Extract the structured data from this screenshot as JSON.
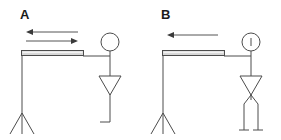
{
  "figure": {
    "width": 281,
    "height": 140,
    "background_color": "#ffffff",
    "line_color": "#4c4c4c",
    "bar_fill_color": "#d6d6d6",
    "label_color": "#1a1a1a",
    "panels": [
      {
        "id": "panel-a",
        "label": "A",
        "label_x": 20,
        "label_y": 19,
        "arrows": [
          {
            "id": "arrow-left",
            "direction": "left",
            "x_start": 78,
            "x_end": 26,
            "y": 32
          },
          {
            "id": "arrow-right",
            "direction": "right",
            "x_start": 26,
            "x_end": 78,
            "y": 41
          }
        ],
        "stand": {
          "pole_x": 22,
          "pole_top_y": 53,
          "pole_bottom_y": 112,
          "tripod_spread": 13,
          "tripod_bottom_y": 133
        },
        "bar": {
          "x": 21,
          "y": 50,
          "width": 62,
          "height": 5
        },
        "arm": {
          "x_start": 83,
          "x_end": 110,
          "y": 56
        },
        "person": {
          "head_cx": 110,
          "head_cy": 42,
          "head_r": 9,
          "head_detail": "none",
          "spine_x": 110,
          "spine_top_y": 51,
          "spine_bottom_y": 122,
          "torso_top_y": 76,
          "torso_bottom_y": 95,
          "torso_half_width": 11,
          "legs": "single",
          "foot_x_end": 100,
          "foot_y": 122
        }
      },
      {
        "id": "panel-b",
        "label": "B",
        "label_x": 161,
        "label_y": 19,
        "arrows": [
          {
            "id": "arrow-left",
            "direction": "left",
            "x_start": 218,
            "x_end": 167,
            "y": 35
          }
        ],
        "stand": {
          "pole_x": 163,
          "pole_top_y": 53,
          "pole_bottom_y": 112,
          "tripod_spread": 13,
          "tripod_bottom_y": 133
        },
        "bar": {
          "x": 162,
          "y": 50,
          "width": 62,
          "height": 5
        },
        "arm": {
          "x_start": 224,
          "x_end": 251,
          "y": 56
        },
        "person": {
          "head_cx": 251,
          "head_cy": 42,
          "head_r": 9,
          "head_detail": "vertical-tick",
          "spine_x": 251,
          "spine_top_y": 51,
          "spine_bottom_y": 100,
          "torso_top_y": 76,
          "torso_bottom_y": 95,
          "torso_half_width": 11,
          "legs": "double",
          "leg_left_x": 244,
          "leg_right_x": 258,
          "leg_bottom_y": 130,
          "ground_y": 130
        }
      }
    ]
  }
}
